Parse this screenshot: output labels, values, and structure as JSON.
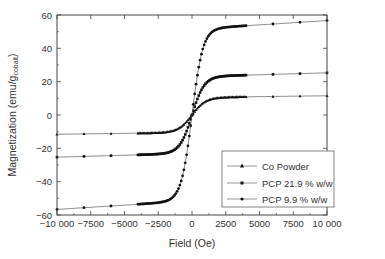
{
  "chart_data": {
    "type": "line",
    "title": "",
    "xlabel": "Field (Oe)",
    "ylabel": "Magnetization (emu/g",
    "ylabel_sub": "cobalt",
    "ylabel_end": ")",
    "xlim": [
      -10000,
      10000
    ],
    "ylim": [
      -60,
      60
    ],
    "x_ticks": [
      -10000,
      -7500,
      -5000,
      -2500,
      0,
      2500,
      5000,
      7500,
      10000
    ],
    "x_tick_labels": [
      "−10 000",
      "−7500",
      "−5000",
      "−2500",
      "0",
      "2500",
      "5000",
      "7500",
      "10 000"
    ],
    "y_ticks": [
      -60,
      -40,
      -20,
      0,
      20,
      40,
      60
    ],
    "y_tick_labels": [
      "−60",
      "−40",
      "−20",
      "0",
      "20",
      "40",
      "60"
    ],
    "grid": false,
    "legend_position": "lower right",
    "series": [
      {
        "name": "Co Powder",
        "marker": "triangle",
        "saturation": 10.5,
        "at_neg_max": -9,
        "k": 1000
      },
      {
        "name": "PCP 21.9 % w/w",
        "marker": "square",
        "saturation": 23,
        "at_neg_max": -21.5,
        "k": 900
      },
      {
        "name": "PCP 9.9 % w/w",
        "marker": "circle",
        "saturation": 51.5,
        "at_neg_max": -49.5,
        "k": 800
      }
    ]
  },
  "legend": {
    "items": [
      "Co Powder",
      "PCP 21.9 % w/w",
      "PCP 9.9 % w/w"
    ]
  }
}
